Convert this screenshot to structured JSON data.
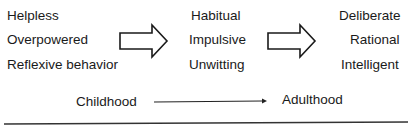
{
  "diagram": {
    "stage1": {
      "items": [
        "Helpless",
        "Overpowered",
        "Reflexive behavior"
      ]
    },
    "stage2": {
      "items": [
        "Habitual",
        "Impulsive",
        "Unwitting"
      ]
    },
    "stage3": {
      "items": [
        "Deliberate",
        "Rational",
        "Intelligent"
      ]
    },
    "arrows": [
      {
        "from": "stage1",
        "to": "stage2",
        "style": "block-outline"
      },
      {
        "from": "stage2",
        "to": "stage3",
        "style": "block-outline"
      }
    ],
    "timeline": {
      "start_label": "Childhood",
      "end_label": "Adulthood"
    },
    "colors": {
      "text": "#1a1a1a",
      "stroke": "#1a1a1a",
      "background": "#ffffff"
    }
  }
}
